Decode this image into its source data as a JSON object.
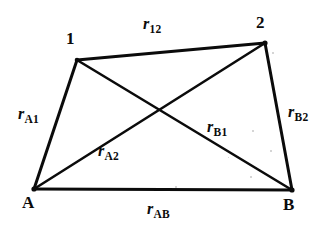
{
  "figure": {
    "background_color": "#ffffff",
    "ink_color": "#0b0b0b",
    "width": 323,
    "height": 227
  },
  "vertices": [
    {
      "id": "v1",
      "label": "1",
      "x": 77,
      "y": 60,
      "label_x": 66,
      "label_y": 30
    },
    {
      "id": "v2",
      "label": "2",
      "x": 265,
      "y": 43,
      "label_x": 256,
      "label_y": 14
    },
    {
      "id": "vA",
      "label": "A",
      "x": 34,
      "y": 189,
      "label_x": 22,
      "label_y": 194
    },
    {
      "id": "vB",
      "label": "B",
      "x": 292,
      "y": 190,
      "label_x": 283,
      "label_y": 196
    }
  ],
  "segments": [
    {
      "id": "s12",
      "from": "v1",
      "to": "v2",
      "kind": "edge",
      "label_r": "r",
      "label_sub": "12",
      "label_x": 143,
      "label_y": 16
    },
    {
      "id": "sA1",
      "from": "vA",
      "to": "v1",
      "kind": "edge",
      "label_r": "r",
      "label_sub": "A1",
      "label_x": 18,
      "label_y": 106
    },
    {
      "id": "sB2",
      "from": "vB",
      "to": "v2",
      "kind": "edge",
      "label_r": "r",
      "label_sub": "B2",
      "label_x": 288,
      "label_y": 104
    },
    {
      "id": "sAB",
      "from": "vA",
      "to": "vB",
      "kind": "edge",
      "label_r": "r",
      "label_sub": "AB",
      "label_x": 147,
      "label_y": 201
    },
    {
      "id": "sA2",
      "from": "vA",
      "to": "v2",
      "kind": "diagonal",
      "label_r": "r",
      "label_sub": "A2",
      "label_x": 98,
      "label_y": 143
    },
    {
      "id": "sB1",
      "from": "vB",
      "to": "v1",
      "kind": "diagonal",
      "label_r": "r",
      "label_sub": "B1",
      "label_x": 207,
      "label_y": 119
    }
  ],
  "intersection": {
    "x": 160,
    "y": 108
  },
  "specks": [
    {
      "x": 252,
      "y": 130,
      "size": 2
    },
    {
      "x": 272,
      "y": 52,
      "size": 2
    },
    {
      "x": 270,
      "y": 150,
      "size": 2
    },
    {
      "x": 250,
      "y": 176,
      "size": 2
    },
    {
      "x": 175,
      "y": 186,
      "size": 2
    },
    {
      "x": 228,
      "y": 157,
      "size": 1
    }
  ]
}
